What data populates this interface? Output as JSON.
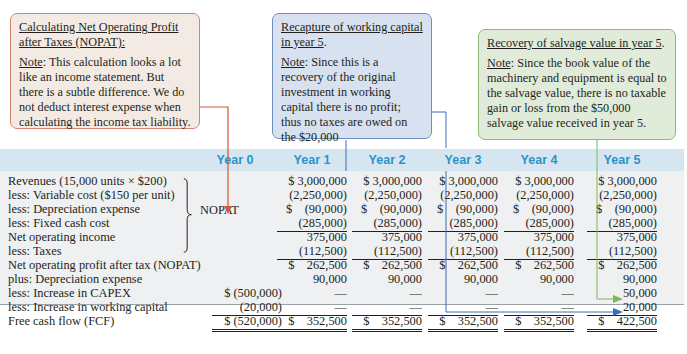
{
  "notes": {
    "nopat": {
      "title": "Calculating Net Operating Profit after Taxes (NOPAT):",
      "note_label": "Note",
      "note_text": ": This calculation looks a lot like an income statement. But there is a subtle difference. We do not deduct interest expense when calculating the income tax liability."
    },
    "working_capital": {
      "title": "Recapture of working capital in year 5",
      "title_suffix": ".",
      "note_label": "Note",
      "note_text": ": Since this is a recovery of the original investment in working capital there is no profit; thus no taxes are owed on the $20,000"
    },
    "salvage": {
      "title": "Recovery of salvage value in year 5",
      "title_suffix": ".",
      "note_label": "Note",
      "note_text": ": Since the book value of the machinery and equipment is equal to the salvage value, there is no taxable gain or loss from the $50,000 salvage value received in year 5."
    }
  },
  "table": {
    "columns": [
      "Year 0",
      "Year 1",
      "Year 2",
      "Year 3",
      "Year 4",
      "Year 5"
    ],
    "bracket_label": "NOPAT",
    "rows": [
      {
        "label": "Revenues (15,000 units × $200)",
        "values": [
          "",
          "$ 3,000,000",
          "$ 3,000,000",
          "$ 3,000,000",
          "$ 3,000,000",
          "$ 3,000,000"
        ]
      },
      {
        "label": "less: Variable cost ($150 per unit)",
        "values": [
          "",
          "(2,250,000)",
          "(2,250,000)",
          "(2,250,000)",
          "(2,250,000)",
          "(2,250,000)"
        ]
      },
      {
        "label": "less: Depreciation expense",
        "values": [
          "",
          "$    (90,000)",
          "$    (90,000)",
          "$    (90,000)",
          "$    (90,000)",
          "$    (90,000)"
        ]
      },
      {
        "label": "less: Fixed cash cost",
        "values": [
          "",
          "(285,000)",
          "(285,000)",
          "(285,000)",
          "(285,000)",
          "(285,000)"
        ]
      },
      {
        "label": "Net operating income",
        "values": [
          "",
          "375,000",
          "375,000",
          "375,000",
          "375,000",
          "375,000"
        ]
      },
      {
        "label": "less: Taxes",
        "values": [
          "",
          "(112,500)",
          "(112,500)",
          "(112,500)",
          "(112,500)",
          "(112,500)"
        ]
      },
      {
        "label": "Net operating profit after tax (NOPAT)",
        "values": [
          "",
          "$    262,500",
          "$    262,500",
          "$    262,500",
          "$    262,500",
          "$    262,500"
        ]
      },
      {
        "label": "plus: Depreciation expense",
        "values": [
          "",
          "90,000",
          "90,000",
          "90,000",
          "90,000",
          "90,000"
        ]
      },
      {
        "label": "less: Increase in CAPEX",
        "values": [
          "$ (500,000)",
          "—",
          "—",
          "—",
          "—",
          "50,000"
        ]
      },
      {
        "label": "less: Increase in working capital",
        "values": [
          "(20,000)",
          "—",
          "—",
          "—",
          "—",
          "20,000"
        ]
      },
      {
        "label": "Free cash flow (FCF)",
        "values": [
          "$ (520,000)",
          "$    352,500",
          "$    352,500",
          "$    352,500",
          "$    352,500",
          "$    422,500"
        ]
      }
    ]
  },
  "colors": {
    "header_text": "#2a93cc",
    "nopat_arrow": "#d9533a",
    "wc_arrow": "#3b6fb5",
    "salvage_arrow": "#7ab85a"
  }
}
